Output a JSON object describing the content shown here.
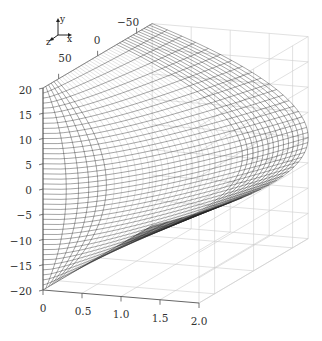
{
  "chart_data": {
    "type": "surface3d",
    "title": "",
    "axes": {
      "x": {
        "label": "x",
        "range": [
          0,
          2.0
        ],
        "ticks": [
          "0",
          "0.5",
          "1.0",
          "1.5",
          "2.0"
        ]
      },
      "y": {
        "label": "y",
        "range": [
          -20,
          20
        ],
        "ticks": [
          "20",
          "15",
          "10",
          "5",
          "0",
          "−5",
          "−10",
          "−15",
          "−20"
        ]
      },
      "z": {
        "label": "z",
        "range": [
          -70,
          70
        ],
        "ticks": [
          "−50",
          "0",
          "50"
        ]
      }
    },
    "surface": {
      "profile": "x = 2.0 * (1 - (y/20)^2) at back; x decreases toward front (z=+70)",
      "x_max": 2.0,
      "y_range": [
        -20,
        20
      ],
      "mesh_rows": 40,
      "mesh_cols": 40
    },
    "grid": true,
    "triad": {
      "x": "x",
      "y": "y",
      "z": "z"
    },
    "colors": {
      "mesh": "#222222",
      "grid": "#cccccc",
      "axis": "#555555"
    }
  }
}
